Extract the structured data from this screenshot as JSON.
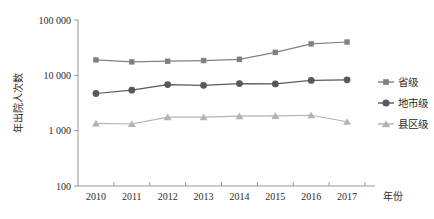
{
  "chart_data": {
    "type": "line",
    "title": "",
    "xlabel": "年份",
    "ylabel": "年出院人次数",
    "x": [
      "2010",
      "2011",
      "2012",
      "2013",
      "2014",
      "2015",
      "2016",
      "2017"
    ],
    "categories": [
      "2010",
      "2011",
      "2012",
      "2013",
      "2014",
      "2015",
      "2016",
      "2017"
    ],
    "yscale": "log",
    "ylim": [
      100,
      100000
    ],
    "ytick_labels": [
      "100 000",
      "10 000",
      "1 000",
      "100"
    ],
    "ytick_values": [
      100000,
      10000,
      1000,
      100
    ],
    "grid": false,
    "legend_position": "right",
    "series": [
      {
        "name": "省级",
        "marker": "square",
        "color": "#808080",
        "values": [
          19000,
          17500,
          18000,
          18500,
          19500,
          26000,
          37000,
          40000
        ]
      },
      {
        "name": "地市级",
        "marker": "circle",
        "color": "#595959",
        "values": [
          4700,
          5400,
          6800,
          6600,
          7100,
          7000,
          8100,
          8300
        ]
      },
      {
        "name": "县区级",
        "marker": "triangle",
        "color": "#b3b3b3",
        "values": [
          1350,
          1320,
          1750,
          1750,
          1830,
          1850,
          1900,
          1450
        ]
      }
    ]
  },
  "legend": {
    "items": [
      {
        "label": "省级"
      },
      {
        "label": "地市级"
      },
      {
        "label": "县区级"
      }
    ]
  },
  "axes": {
    "y_title": "年出院人次数",
    "x_title": "年份"
  }
}
